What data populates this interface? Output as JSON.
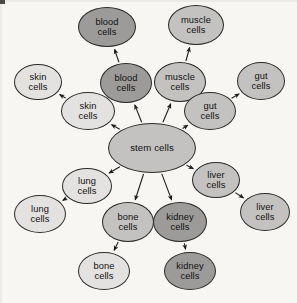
{
  "diagram": {
    "type": "radial-node-graph",
    "background_color": "#f7f6f3",
    "stroke_color": "#2a2a2a",
    "tones": {
      "light": "#e3e2e0",
      "medium": "#c3c2c0",
      "dark": "#9c9b99"
    },
    "center": {
      "id": "stem-cells",
      "label": "stem cells",
      "tone": "medium",
      "cx": 152,
      "cy": 148,
      "rx": 44,
      "ry": 25
    },
    "inner_ring": [
      {
        "id": "skin-inner",
        "label": "skin\ncells",
        "tone": "light",
        "cx": 88,
        "cy": 111,
        "rx": 27,
        "ry": 19
      },
      {
        "id": "blood-inner",
        "label": "blood\ncells",
        "tone": "dark",
        "cx": 126,
        "cy": 83,
        "rx": 26,
        "ry": 20
      },
      {
        "id": "muscle-inner",
        "label": "muscle\ncells",
        "tone": "medium",
        "cx": 180,
        "cy": 82,
        "rx": 26,
        "ry": 20
      },
      {
        "id": "gut-inner",
        "label": "gut\ncells",
        "tone": "medium",
        "cx": 210,
        "cy": 111,
        "rx": 26,
        "ry": 19
      },
      {
        "id": "liver-inner",
        "label": "liver\ncells",
        "tone": "medium",
        "cx": 216,
        "cy": 180,
        "rx": 24,
        "ry": 18
      },
      {
        "id": "kidney-inner",
        "label": "kidney\ncells",
        "tone": "dark",
        "cx": 180,
        "cy": 222,
        "rx": 27,
        "ry": 20
      },
      {
        "id": "bone-inner",
        "label": "bone\ncells",
        "tone": "medium",
        "cx": 128,
        "cy": 222,
        "rx": 26,
        "ry": 20
      },
      {
        "id": "lung-inner",
        "label": "lung\ncells",
        "tone": "light",
        "cx": 87,
        "cy": 186,
        "rx": 25,
        "ry": 18
      }
    ],
    "outer_ring": [
      {
        "id": "skin-outer",
        "label": "skin\ncells",
        "tone": "light",
        "cx": 38,
        "cy": 82,
        "rx": 24,
        "ry": 18
      },
      {
        "id": "blood-outer",
        "label": "blood\ncells",
        "tone": "dark",
        "cx": 107,
        "cy": 27,
        "rx": 29,
        "ry": 20
      },
      {
        "id": "muscle-outer",
        "label": "muscle\ncells",
        "tone": "medium",
        "cx": 196,
        "cy": 25,
        "rx": 28,
        "ry": 20
      },
      {
        "id": "gut-outer",
        "label": "gut\ncells",
        "tone": "medium",
        "cx": 261,
        "cy": 81,
        "rx": 24,
        "ry": 19
      },
      {
        "id": "liver-outer",
        "label": "liver\ncells",
        "tone": "medium",
        "cx": 265,
        "cy": 212,
        "rx": 25,
        "ry": 19
      },
      {
        "id": "kidney-outer",
        "label": "kidney\ncells",
        "tone": "dark",
        "cx": 190,
        "cy": 271,
        "rx": 26,
        "ry": 19
      },
      {
        "id": "bone-outer",
        "label": "bone\ncells",
        "tone": "light",
        "cx": 104,
        "cy": 271,
        "rx": 26,
        "ry": 19
      },
      {
        "id": "lung-outer",
        "label": "lung\ncells",
        "tone": "light",
        "cx": 40,
        "cy": 214,
        "rx": 26,
        "ry": 19
      }
    ],
    "edges": [
      {
        "from": "stem-cells",
        "to": "skin-inner"
      },
      {
        "from": "stem-cells",
        "to": "blood-inner"
      },
      {
        "from": "stem-cells",
        "to": "muscle-inner"
      },
      {
        "from": "stem-cells",
        "to": "gut-inner"
      },
      {
        "from": "stem-cells",
        "to": "liver-inner"
      },
      {
        "from": "stem-cells",
        "to": "kidney-inner"
      },
      {
        "from": "stem-cells",
        "to": "bone-inner"
      },
      {
        "from": "stem-cells",
        "to": "lung-inner"
      },
      {
        "from": "skin-inner",
        "to": "skin-outer"
      },
      {
        "from": "blood-inner",
        "to": "blood-outer"
      },
      {
        "from": "muscle-inner",
        "to": "muscle-outer"
      },
      {
        "from": "gut-inner",
        "to": "gut-outer"
      },
      {
        "from": "liver-inner",
        "to": "liver-outer"
      },
      {
        "from": "kidney-inner",
        "to": "kidney-outer"
      },
      {
        "from": "bone-inner",
        "to": "bone-outer"
      },
      {
        "from": "lung-inner",
        "to": "lung-outer"
      }
    ]
  }
}
